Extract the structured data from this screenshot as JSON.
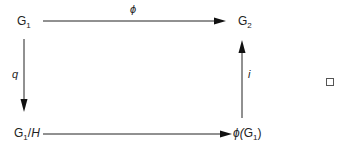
{
  "diagram": {
    "type": "commutative-diagram",
    "nodes": {
      "g1": {
        "base": "G",
        "sub": "1",
        "suffix": ""
      },
      "g2": {
        "base": "G",
        "sub": "2",
        "suffix": ""
      },
      "quotient": {
        "base": "G",
        "sub": "1",
        "suffix": "/",
        "suffix_italic": "H"
      },
      "image": {
        "prefix": "ϕ(",
        "base": "G",
        "sub": "1",
        "suffix": ")"
      }
    },
    "edges": [
      {
        "from": "G1",
        "to": "G2",
        "label": "ϕ",
        "direction": "right"
      },
      {
        "from": "G1",
        "to": "G1/H",
        "label": "q",
        "direction": "down"
      },
      {
        "from": "G1/H",
        "to": "ϕ(G1)",
        "label": "",
        "direction": "right"
      },
      {
        "from": "ϕ(G1)",
        "to": "G2",
        "label": "i",
        "direction": "up"
      }
    ],
    "labels": {
      "top": "ϕ",
      "left": "q",
      "right": "i"
    },
    "end_marker": "qed-square",
    "colors": {
      "stroke": "#222222",
      "text": "#222222",
      "background": "#ffffff"
    }
  }
}
